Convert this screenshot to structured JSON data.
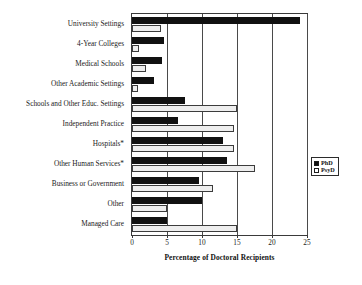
{
  "chart_data": {
    "type": "bar",
    "orientation": "horizontal",
    "title": "",
    "xlabel": "Percentage of Doctoral Recipients",
    "ylabel": "",
    "xlim": [
      0,
      25
    ],
    "xticks": [
      0,
      5,
      10,
      15,
      20,
      25
    ],
    "grid": true,
    "grid_axis": "x",
    "legend_position": "right",
    "categories": [
      "University Settings",
      "4-Year Colleges",
      "Medical Schools",
      "Other Academic Settings",
      "Schools and Other Educ. Settings",
      "Independent Practice",
      "Hospitals*",
      "Other Human Services*",
      "Business or Government",
      "Other",
      "Managed Care"
    ],
    "series": [
      {
        "name": "PhD",
        "color": "#111111",
        "values": [
          24.0,
          4.5,
          4.3,
          3.2,
          7.5,
          6.5,
          13.0,
          13.5,
          9.5,
          10.0,
          5.0
        ]
      },
      {
        "name": "PsyD",
        "color": "#eeeeee",
        "values": [
          4.2,
          1.0,
          2.0,
          0.8,
          15.0,
          14.5,
          14.5,
          17.5,
          11.5,
          5.0,
          15.0
        ]
      }
    ]
  },
  "legend": {
    "items": [
      {
        "label": "PhD",
        "swatch": "filled-square"
      },
      {
        "label": "PsyD",
        "swatch": "open-square"
      }
    ]
  }
}
